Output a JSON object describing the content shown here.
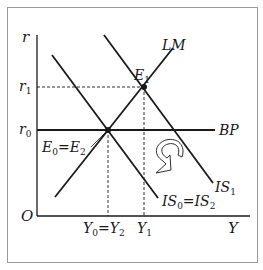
{
  "diagram": {
    "axes": {
      "y_label": "r",
      "x_label": "Y",
      "origin_label": "O"
    },
    "y_ticks": [
      {
        "label": "r",
        "sub": "1"
      },
      {
        "label": "r",
        "sub": "0"
      }
    ],
    "x_ticks": [
      {
        "label": "Y",
        "sub": "0",
        "eq": "=",
        "label2": "Y",
        "sub2": "2"
      },
      {
        "label": "Y",
        "sub": "1"
      }
    ],
    "curves": {
      "lm": {
        "label": "LM"
      },
      "bp": {
        "label": "BP"
      },
      "is1": {
        "label": "IS",
        "sub": "1"
      },
      "is0": {
        "label": "IS",
        "sub": "0",
        "eq": "=",
        "label2": "IS",
        "sub2": "2"
      }
    },
    "points": {
      "e1": {
        "label": "E",
        "sub": "1"
      },
      "e0": {
        "label": "E",
        "sub": "0",
        "eq": "=",
        "label2": "E",
        "sub2": "2"
      }
    },
    "arrow": {
      "icon": "curved-return-arrow-icon",
      "meaning": "IS1 shifts back to IS2"
    },
    "colors": {
      "line": "#1a1a1a",
      "frame": "#9a9a9a",
      "background": "#ffffff"
    }
  }
}
